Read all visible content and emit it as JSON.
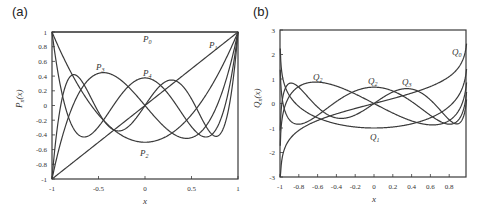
{
  "chart_data": [
    {
      "panel_label": "(a)",
      "type": "line",
      "title": "",
      "xlabel": "x",
      "ylabel": "P_n(x)",
      "xlim": [
        -1,
        1
      ],
      "ylim": [
        -1,
        1
      ],
      "xticks": [
        "-1",
        "-0.5",
        "0",
        "0.5",
        "1"
      ],
      "yticks": [
        "1",
        "0.8",
        "0.6",
        "0.4",
        "0.2",
        "0",
        "-0.2",
        "-0.4",
        "-0.6",
        "-0.8",
        "-1"
      ],
      "grid": false,
      "series": [
        {
          "name": "P0",
          "function": "1",
          "x": [
            -1,
            0,
            1
          ],
          "values": [
            1,
            1,
            1
          ]
        },
        {
          "name": "P1",
          "function": "x",
          "x": [
            -1,
            0,
            1
          ],
          "values": [
            -1,
            0,
            1
          ]
        },
        {
          "name": "P2",
          "function": "(3x^2-1)/2",
          "x": [
            -1,
            -0.5,
            0,
            0.5,
            1
          ],
          "values": [
            1,
            -0.125,
            -0.5,
            -0.125,
            1
          ]
        },
        {
          "name": "P3",
          "function": "(5x^3-3x)/2",
          "x": [
            -1,
            -0.447,
            0,
            0.447,
            1
          ],
          "values": [
            -1,
            0.447,
            0,
            -0.447,
            1
          ]
        },
        {
          "name": "P4",
          "function": "(35x^4-30x^2+3)/8",
          "x": [
            -1,
            -0.655,
            0,
            0.655,
            1
          ],
          "values": [
            1,
            -0.429,
            0.375,
            -0.429,
            1
          ]
        },
        {
          "name": "P5",
          "function": "(63x^5-70x^3+15x)/8",
          "x": [
            -1,
            -0.765,
            -0.285,
            0,
            0.285,
            0.765,
            1
          ],
          "values": [
            -1,
            0.35,
            -0.42,
            0,
            0.42,
            -0.35,
            1
          ]
        }
      ],
      "annotations": [
        {
          "text": "P0",
          "x": 0,
          "y": 0.9
        },
        {
          "text": "P1",
          "x": 0.8,
          "y": 0.75
        },
        {
          "text": "P3",
          "x": -0.52,
          "y": 0.5
        },
        {
          "text": "P4",
          "x": 0.03,
          "y": 0.43
        },
        {
          "text": "P2",
          "x": -0.05,
          "y": -0.72
        }
      ]
    },
    {
      "panel_label": "(b)",
      "type": "line",
      "title": "",
      "xlabel": "x",
      "ylabel": "Q_n(x)",
      "xlim": [
        -1,
        1
      ],
      "ylim": [
        -3,
        3
      ],
      "xticks": [
        "-1",
        "-0.8",
        "-0.6",
        "-0.4",
        "-0.2",
        "0",
        "0.2",
        "0.4",
        "0.6",
        "0.8"
      ],
      "yticks": [
        "3",
        "2",
        "1",
        "0",
        "-1",
        "-2",
        "-3"
      ],
      "grid": false,
      "series": [
        {
          "name": "Q0",
          "function": "0.5*ln((1+x)/(1-x))"
        },
        {
          "name": "Q1",
          "function": "x*Q0 - 1"
        },
        {
          "name": "Q2",
          "function": "P2*Q0 - 1.5x"
        },
        {
          "name": "Q3",
          "function": "P3*Q0 - 2.5x^2 + 2/3"
        },
        {
          "name": "Q4",
          "function": "P4*Q0 - 35x^3/8 + 55x/24"
        }
      ],
      "annotations": [
        {
          "text": "Q0",
          "x": 0.9,
          "y": 2.05
        },
        {
          "text": "Q2",
          "x": -0.58,
          "y": 0.95
        },
        {
          "text": "Q2",
          "x": 0.0,
          "y": 0.8
        },
        {
          "text": "Q3",
          "x": 0.3,
          "y": 0.75
        },
        {
          "text": "Q1",
          "x": -0.03,
          "y": -1.35
        }
      ]
    }
  ],
  "labels": {
    "panel_a": "(a)",
    "panel_b": "(b)",
    "a_ylabel_main": "P",
    "a_ylabel_sub": "n",
    "a_ylabel_arg": "(x)",
    "b_ylabel_main": "Q",
    "b_ylabel_sub": "n",
    "b_ylabel_arg": "(x)",
    "xlabel": "x",
    "a_curves": [
      {
        "main": "P",
        "sub": "0"
      },
      {
        "main": "P",
        "sub": "1"
      },
      {
        "main": "P",
        "sub": "3"
      },
      {
        "main": "P",
        "sub": "4"
      },
      {
        "main": "P",
        "sub": "2"
      }
    ],
    "b_curves": [
      {
        "main": "Q",
        "sub": "0"
      },
      {
        "main": "Q",
        "sub": "2"
      },
      {
        "main": "Q",
        "sub": "2"
      },
      {
        "main": "Q",
        "sub": "3"
      },
      {
        "main": "Q",
        "sub": "1"
      }
    ]
  }
}
